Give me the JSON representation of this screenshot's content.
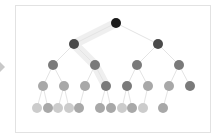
{
  "diagram": {
    "type": "tree",
    "levels": 5,
    "colors": {
      "level0": "#1a1a1a",
      "level1": "#4a4a4a",
      "level2": "#7a7a7a",
      "level3": "#a8a8a8",
      "level4": "#cccccc",
      "edge": "#e4e4e4",
      "highlight": "#efefef"
    },
    "nodes": [
      {
        "id": "n0",
        "x": 116,
        "y": 23,
        "level": 0
      },
      {
        "id": "n1",
        "x": 74,
        "y": 44,
        "level": 1
      },
      {
        "id": "n2",
        "x": 158,
        "y": 44,
        "level": 1
      },
      {
        "id": "n3",
        "x": 53,
        "y": 65,
        "level": 2
      },
      {
        "id": "n4",
        "x": 95,
        "y": 65,
        "level": 2
      },
      {
        "id": "n5",
        "x": 137,
        "y": 65,
        "level": 2
      },
      {
        "id": "n6",
        "x": 179,
        "y": 65,
        "level": 2
      },
      {
        "id": "n7",
        "x": 43,
        "y": 86,
        "level": 3
      },
      {
        "id": "n8",
        "x": 64,
        "y": 86,
        "level": 3
      },
      {
        "id": "n9",
        "x": 85,
        "y": 86,
        "level": 3
      },
      {
        "id": "n10",
        "x": 106,
        "y": 86,
        "level": 3,
        "shade": "level2"
      },
      {
        "id": "n11",
        "x": 127,
        "y": 86,
        "level": 3,
        "shade": "level2"
      },
      {
        "id": "n12",
        "x": 148,
        "y": 86,
        "level": 3
      },
      {
        "id": "n13",
        "x": 169,
        "y": 86,
        "level": 3
      },
      {
        "id": "n14",
        "x": 190,
        "y": 86,
        "level": 3,
        "shade": "level2"
      },
      {
        "id": "n15",
        "x": 37,
        "y": 108,
        "level": 4
      },
      {
        "id": "n16",
        "x": 48,
        "y": 108,
        "level": 4,
        "shade": "level3"
      },
      {
        "id": "n17",
        "x": 58,
        "y": 108,
        "level": 4
      },
      {
        "id": "n18",
        "x": 69,
        "y": 108,
        "level": 4
      },
      {
        "id": "n19",
        "x": 79,
        "y": 108,
        "level": 4,
        "shade": "level3"
      },
      {
        "id": "n20",
        "x": 100,
        "y": 108,
        "level": 4,
        "shade": "level3"
      },
      {
        "id": "n21",
        "x": 111,
        "y": 108,
        "level": 4,
        "shade": "level3"
      },
      {
        "id": "n22",
        "x": 122,
        "y": 108,
        "level": 4
      },
      {
        "id": "n23",
        "x": 132,
        "y": 108,
        "level": 4,
        "shade": "level3"
      },
      {
        "id": "n24",
        "x": 143,
        "y": 108,
        "level": 4
      },
      {
        "id": "n25",
        "x": 163,
        "y": 108,
        "level": 4,
        "shade": "level3"
      }
    ],
    "edges": [
      [
        "n0",
        "n1"
      ],
      [
        "n0",
        "n2"
      ],
      [
        "n1",
        "n3"
      ],
      [
        "n1",
        "n4"
      ],
      [
        "n2",
        "n5"
      ],
      [
        "n2",
        "n6"
      ],
      [
        "n3",
        "n7"
      ],
      [
        "n3",
        "n8"
      ],
      [
        "n4",
        "n9"
      ],
      [
        "n4",
        "n10"
      ],
      [
        "n5",
        "n11"
      ],
      [
        "n5",
        "n12"
      ],
      [
        "n6",
        "n13"
      ],
      [
        "n6",
        "n14"
      ],
      [
        "n7",
        "n15"
      ],
      [
        "n7",
        "n16"
      ],
      [
        "n8",
        "n17"
      ],
      [
        "n8",
        "n18"
      ],
      [
        "n9",
        "n19"
      ],
      [
        "n10",
        "n20"
      ],
      [
        "n10",
        "n21"
      ],
      [
        "n11",
        "n22"
      ],
      [
        "n11",
        "n23"
      ],
      [
        "n12",
        "n24"
      ],
      [
        "n13",
        "n25"
      ]
    ],
    "highlight_path": [
      "n0",
      "n1",
      "n4",
      "n10"
    ]
  }
}
